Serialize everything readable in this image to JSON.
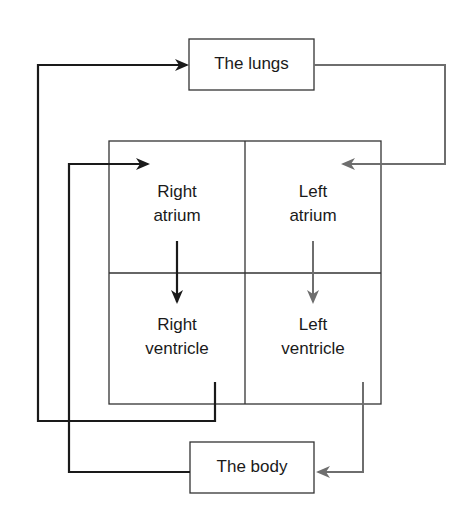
{
  "diagram": {
    "type": "blood-circulation-flow",
    "colors": {
      "deoxygenated_path": "#1a1a1a",
      "oxygenated_path": "#6e6e6e",
      "box_border": "#333333"
    },
    "nodes": {
      "lungs": {
        "label": "The lungs"
      },
      "body": {
        "label": "The body"
      },
      "right_atrium": {
        "line1": "Right",
        "line2": "atrium"
      },
      "left_atrium": {
        "line1": "Left",
        "line2": "atrium"
      },
      "right_ventricle": {
        "line1": "Right",
        "line2": "ventricle"
      },
      "left_ventricle": {
        "line1": "Left",
        "line2": "ventricle"
      }
    },
    "edges": [
      {
        "from": "right_ventricle",
        "to": "lungs",
        "color": "black"
      },
      {
        "from": "lungs",
        "to": "left_atrium",
        "color": "gray"
      },
      {
        "from": "left_atrium",
        "to": "left_ventricle",
        "color": "gray"
      },
      {
        "from": "left_ventricle",
        "to": "body",
        "color": "gray"
      },
      {
        "from": "body",
        "to": "right_atrium",
        "color": "black"
      },
      {
        "from": "right_atrium",
        "to": "right_ventricle",
        "color": "black"
      }
    ]
  }
}
